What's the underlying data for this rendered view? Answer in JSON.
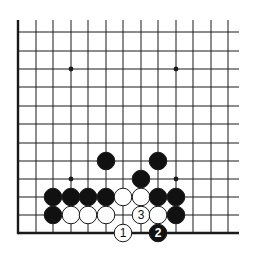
{
  "diagram": {
    "type": "go-board-fragment",
    "colors": {
      "line": "#1a1a1a",
      "black_stone": "#111111",
      "white_stone": "#ffffff",
      "background": "#ffffff"
    },
    "grid": {
      "columns_x": [
        18,
        36,
        53,
        71,
        88,
        106,
        123,
        141,
        158,
        176,
        193,
        211,
        228
      ],
      "rows_y": [
        32,
        51,
        69,
        87,
        106,
        124,
        143,
        161,
        179,
        197,
        215,
        233
      ],
      "top_y": 20,
      "right_x": 239,
      "left_edge": true,
      "bottom_edge": true
    },
    "star_points": [
      {
        "col": 3,
        "row": 2
      },
      {
        "col": 9,
        "row": 2
      },
      {
        "col": 3,
        "row": 8
      },
      {
        "col": 9,
        "row": 8
      }
    ],
    "stones": [
      {
        "color": "black",
        "col": 5,
        "row": 7
      },
      {
        "color": "black",
        "col": 8,
        "row": 7
      },
      {
        "color": "black",
        "col": 7,
        "row": 8
      },
      {
        "color": "black",
        "col": 2,
        "row": 9
      },
      {
        "color": "black",
        "col": 3,
        "row": 9
      },
      {
        "color": "black",
        "col": 4,
        "row": 9
      },
      {
        "color": "black",
        "col": 5,
        "row": 9
      },
      {
        "color": "white",
        "col": 6,
        "row": 9
      },
      {
        "color": "white",
        "col": 7,
        "row": 9
      },
      {
        "color": "black",
        "col": 8,
        "row": 9
      },
      {
        "color": "black",
        "col": 9,
        "row": 9
      },
      {
        "color": "black",
        "col": 2,
        "row": 10
      },
      {
        "color": "white",
        "col": 3,
        "row": 10
      },
      {
        "color": "white",
        "col": 4,
        "row": 10
      },
      {
        "color": "white",
        "col": 5,
        "row": 10
      },
      {
        "color": "white",
        "col": 7,
        "row": 10,
        "label": "3"
      },
      {
        "color": "white",
        "col": 8,
        "row": 10
      },
      {
        "color": "black",
        "col": 9,
        "row": 10
      },
      {
        "color": "white",
        "col": 6,
        "row": 11,
        "label": "1"
      },
      {
        "color": "black",
        "col": 8,
        "row": 11,
        "label": "2"
      }
    ]
  }
}
